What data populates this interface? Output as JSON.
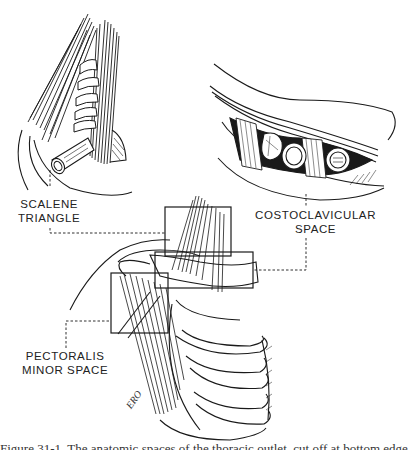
{
  "figure": {
    "labels": {
      "scalene": "SCALENE\nTRIANGLE",
      "scalene_line1": "SCALENE",
      "scalene_line2": "TRIANGLE",
      "costoclavicular_line1": "COSTOCLAVICULAR",
      "costoclavicular_line2": "SPACE",
      "pectoralis_line1": "PECTORALIS",
      "pectoralis_line2": "MINOR SPACE"
    },
    "signature": "ERO",
    "caption_partial": "Figure 31-1. The anatomic spaces of the thoracic outlet, cut off at bottom edge",
    "regions": [
      {
        "name": "scalene-triangle",
        "box": [
          165,
          207,
          231,
          256
        ]
      },
      {
        "name": "costoclavicular-space",
        "box": [
          155,
          252,
          253,
          288
        ]
      },
      {
        "name": "pectoralis-minor-space",
        "box": [
          111,
          273,
          168,
          333
        ]
      }
    ],
    "insets": [
      {
        "name": "scalene-triangle-detail",
        "position": "top-left"
      },
      {
        "name": "costoclavicular-space-detail",
        "position": "top-right"
      }
    ],
    "colors": {
      "ink": "#1a1a1a",
      "background": "#ffffff"
    }
  }
}
